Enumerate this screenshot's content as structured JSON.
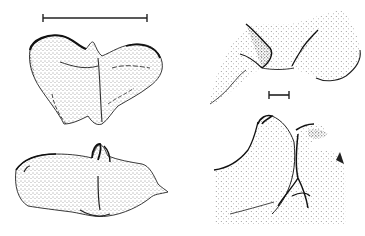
{
  "figure": {
    "background": "#ffffff",
    "ink_color": "#1a1a1a",
    "panels": [
      {
        "id": "top-left",
        "description": "stippled drawing, dorsal view of bilobed structure",
        "position": "top-left"
      },
      {
        "id": "bottom-left",
        "description": "stippled drawing, lateral view with central hooked process",
        "position": "bottom-left"
      },
      {
        "id": "top-right",
        "description": "stippled drawing, detail of notched central region",
        "position": "top-right"
      },
      {
        "id": "bottom-right",
        "description": "stippled drawing, detail of hooked process",
        "position": "bottom-right"
      }
    ],
    "scale_bars": [
      {
        "id": "scale-bar-large",
        "position": "top-left, above first drawing",
        "length_px": 104
      },
      {
        "id": "scale-bar-small",
        "position": "right column, between drawings",
        "length_px": 20
      }
    ]
  }
}
